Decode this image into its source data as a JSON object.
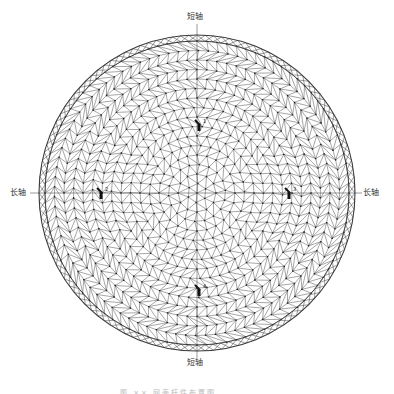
{
  "diagram": {
    "type": "geodesic-dome-plan",
    "axis_labels": {
      "top": "短轴",
      "bottom": "短轴",
      "left": "长轴",
      "right": "长轴"
    },
    "caption": "图 ×× 网壳杆件布置图",
    "geometry": {
      "center_x": 197,
      "center_y": 193,
      "radius": 158,
      "ring_band_width": 6,
      "rings": 16,
      "base_segments": 6
    },
    "colors": {
      "line": "#3a3a3a",
      "node": "#222222",
      "axis": "#555555",
      "marker": "#111111"
    },
    "markers": [
      {
        "name": "marker-top",
        "x": 199,
        "y": 125,
        "label": "1"
      },
      {
        "name": "marker-left",
        "x": 101,
        "y": 193,
        "label": "2"
      },
      {
        "name": "marker-right",
        "x": 289,
        "y": 193,
        "label": "3"
      },
      {
        "name": "marker-bottom",
        "x": 199,
        "y": 290,
        "label": "4"
      }
    ]
  }
}
